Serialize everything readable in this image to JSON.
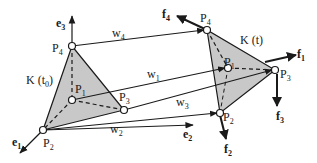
{
  "diagram": {
    "body_initial": {
      "label": "K (t",
      "sub": "0",
      "close": ")"
    },
    "body_current": {
      "label": "K (t)"
    },
    "initial_points": {
      "P1": {
        "label": "P",
        "sub": "1"
      },
      "P2": {
        "label": "P",
        "sub": "2"
      },
      "P3": {
        "label": "P",
        "sub": "3"
      },
      "P4": {
        "label": "P",
        "sub": "4"
      }
    },
    "current_points": {
      "P1": {
        "label": "P",
        "sub": "1"
      },
      "P2": {
        "label": "P",
        "sub": "2"
      },
      "P3": {
        "label": "P",
        "sub": "3"
      },
      "P4": {
        "label": "P",
        "sub": "4"
      }
    },
    "axes": {
      "e1": {
        "label": "e",
        "sub": "1"
      },
      "e2": {
        "label": "e",
        "sub": "2"
      },
      "e3": {
        "label": "e",
        "sub": "3"
      }
    },
    "displacements": {
      "w1": {
        "label": "w",
        "sub": "1"
      },
      "w2": {
        "label": "w",
        "sub": "2"
      },
      "w3": {
        "label": "w",
        "sub": "3"
      },
      "w4": {
        "label": "w",
        "sub": "4"
      }
    },
    "forces": {
      "f1": {
        "label": "f",
        "sub": "1"
      },
      "f2": {
        "label": "f",
        "sub": "2"
      },
      "f3": {
        "label": "f",
        "sub": "3"
      },
      "f4": {
        "label": "f",
        "sub": "4"
      }
    },
    "colors": {
      "fill": "#c8c8c8",
      "stroke": "#1a1a1a"
    }
  }
}
